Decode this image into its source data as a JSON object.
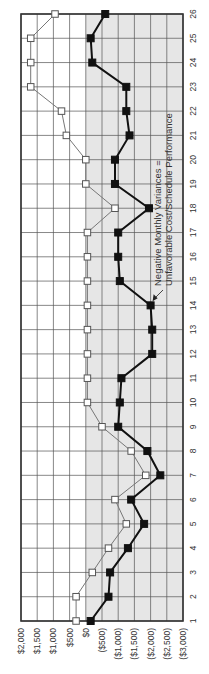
{
  "chart_data": {
    "type": "line",
    "orientation": "rotated-90-ccw",
    "title": "",
    "xlabel": "",
    "ylabel": "",
    "x": [
      1,
      2,
      3,
      4,
      5,
      6,
      7,
      8,
      9,
      10,
      11,
      12,
      13,
      14,
      15,
      16,
      17,
      18,
      19,
      20,
      21,
      22,
      23,
      24,
      25,
      26
    ],
    "x_tick_labels": [
      "1",
      "2",
      "3",
      "4",
      "5",
      "6",
      "7",
      "8",
      "9",
      "10",
      "11",
      "12",
      "13",
      "14",
      "15",
      "16",
      "17",
      "18",
      "19",
      "20",
      "21",
      "22",
      "23",
      "24",
      "25",
      "26"
    ],
    "ylim": [
      -3000,
      2000
    ],
    "y_ticks": [
      2000,
      1500,
      1000,
      500,
      0,
      -500,
      -1000,
      -1500,
      -2000,
      -2500,
      -3000
    ],
    "y_tick_labels": [
      "$2,000",
      "$1,500",
      "$1,000",
      "$500",
      "$0",
      "($500)",
      "($1,000)",
      "($1,500)",
      "($2,000)",
      "($2,500)",
      "($3,000)"
    ],
    "grid": true,
    "negative_region_shaded": true,
    "colors": {
      "negative_region": "#e6e6e6",
      "grid": "#555555",
      "border": "#333333",
      "series_open": "#777777",
      "series_filled": "#111111"
    },
    "series": [
      {
        "name": "Open-square series",
        "marker": "open-square",
        "values": [
          300,
          300,
          -200,
          -700,
          -1250,
          -900,
          -1850,
          -1400,
          -500,
          -50,
          -50,
          -50,
          -50,
          -50,
          -50,
          -50,
          -50,
          -900,
          0,
          0,
          600,
          750,
          1700,
          1700,
          1700,
          950
        ]
      },
      {
        "name": "Filled-square series",
        "marker": "filled-square",
        "values": [
          -150,
          -700,
          -750,
          -1300,
          -1800,
          -1400,
          -2300,
          -1900,
          -1000,
          -1050,
          -1100,
          -2050,
          -2050,
          -2000,
          -1050,
          -1000,
          -1000,
          -1950,
          -900,
          -900,
          -1350,
          -1250,
          -1250,
          -200,
          -150,
          -600
        ]
      }
    ],
    "annotations": [
      {
        "text_line1": "Negative Monthly Variances =",
        "text_line2": "Unfavorable Cost/Schedule Performance",
        "arrow_to": {
          "x": 14,
          "y": -2000
        }
      }
    ],
    "legend": null
  }
}
